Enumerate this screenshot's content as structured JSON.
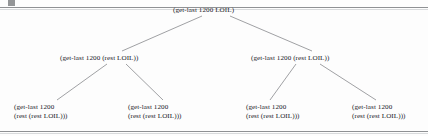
{
  "figure": {
    "type": "recursion-tree",
    "root": {
      "id": "root",
      "lines": [
        "(get-last 1200 LOIL)"
      ]
    },
    "level2": [
      {
        "id": "l2-left",
        "lines": [
          "(get-last 1200 (rest LOIL))"
        ]
      },
      {
        "id": "l2-right",
        "lines": [
          "(get-last 1200 (rest LOIL))"
        ]
      }
    ],
    "level3": [
      {
        "id": "l3-1",
        "lines": [
          "(get-last 1200",
          "(rest (rest LOIL)))"
        ]
      },
      {
        "id": "l3-2",
        "lines": [
          "(get-last 1200",
          "(rest (rest LOIL)))"
        ]
      },
      {
        "id": "l3-3",
        "lines": [
          "(get-last 1200",
          "(rest (rest LOIL)))"
        ]
      },
      {
        "id": "l3-4",
        "lines": [
          "(get-last 1200",
          "(rest (rest LOIL)))"
        ]
      }
    ],
    "colors": {
      "text": "#20201f",
      "edge": "#77797c",
      "rule": "#8f9194",
      "background": "#fdfdfd"
    }
  }
}
